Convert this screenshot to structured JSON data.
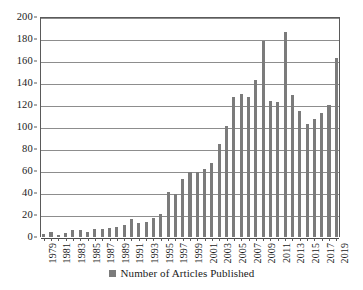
{
  "chart_data": {
    "type": "bar",
    "title": "",
    "xlabel": "",
    "ylabel": "",
    "ylim": [
      0,
      200
    ],
    "ytick_step": 20,
    "yticks": [
      0,
      20,
      40,
      60,
      80,
      100,
      120,
      140,
      160,
      180,
      200
    ],
    "grid": "horizontal",
    "legend_position": "bottom-center",
    "legend": [
      "Number of Articles Published"
    ],
    "series_name": "Number of Articles Published",
    "bar_color": "#7b7b7b",
    "gridline_color": "#8d8d8d",
    "axis_color": "#5a5a5a",
    "xtick_labels_shown": [
      "1979",
      "1981",
      "1983",
      "1985",
      "1987",
      "1989",
      "1991",
      "1993",
      "1995",
      "1997",
      "1999",
      "2001",
      "2003",
      "2005",
      "2007",
      "2009",
      "2011",
      "2013",
      "2015",
      "2017",
      "2019"
    ],
    "categories": [
      "1979",
      "1980",
      "1981",
      "1982",
      "1983",
      "1984",
      "1985",
      "1986",
      "1987",
      "1988",
      "1989",
      "1990",
      "1991",
      "1992",
      "1993",
      "1994",
      "1995",
      "1996",
      "1997",
      "1998",
      "1999",
      "2000",
      "2001",
      "2002",
      "2003",
      "2004",
      "2005",
      "2006",
      "2007",
      "2008",
      "2009",
      "2010",
      "2011",
      "2012",
      "2013",
      "2014",
      "2015",
      "2016",
      "2017",
      "2018",
      "2019"
    ],
    "values": [
      3,
      5,
      2,
      4,
      6,
      6,
      5,
      7,
      7,
      8,
      9,
      11,
      16,
      13,
      14,
      17,
      21,
      41,
      39,
      53,
      59,
      59,
      62,
      67,
      85,
      101,
      127,
      130,
      127,
      143,
      178,
      124,
      123,
      186,
      129,
      115,
      103,
      107,
      113,
      120,
      163
    ],
    "values_tail": [
      122,
      15
    ],
    "all_values": [
      3,
      5,
      2,
      4,
      6,
      6,
      5,
      7,
      7,
      8,
      9,
      11,
      16,
      13,
      14,
      17,
      21,
      41,
      39,
      53,
      59,
      59,
      62,
      67,
      85,
      101,
      127,
      130,
      127,
      143,
      178,
      124,
      123,
      186,
      129,
      115,
      103,
      107,
      113,
      120,
      163
    ],
    "note_partial_last_year": true
  },
  "legend": {
    "label": "Number of Articles Published",
    "swatch_name": "legend-color-swatch"
  }
}
